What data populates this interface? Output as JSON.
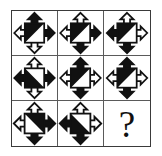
{
  "puzzle": {
    "type": "visual-analogy-matrix",
    "rows": 3,
    "columns": 3,
    "missing_cell_label": "?",
    "colors": {
      "fill_dark": "#111111",
      "fill_light": "#ffffff",
      "stroke": "#111111",
      "grid_line": "#5a5a5a",
      "outer_border": "#3a3a3a",
      "background": "#ffffff"
    },
    "cells": [
      {
        "id": "cell-1-1",
        "position": "row 1, column 1",
        "kind": "figure",
        "square_diagonal": "bottom-left-to-top-right",
        "square_dark_half": "upper-left",
        "arrows": {
          "up": "dark",
          "left": "light",
          "right": "dark",
          "down": "light"
        }
      },
      {
        "id": "cell-1-2",
        "position": "row 1, column 2",
        "kind": "figure",
        "square_diagonal": "bottom-left-to-top-right",
        "square_dark_half": "upper-left",
        "arrows": {
          "up": "light",
          "left": "light",
          "right": "dark",
          "down": "dark"
        }
      },
      {
        "id": "cell-1-3",
        "position": "row 1, column 3",
        "kind": "figure",
        "square_diagonal": "bottom-left-to-top-right",
        "square_dark_half": "upper-left",
        "arrows": {
          "up": "light",
          "left": "dark",
          "right": "light",
          "down": "dark"
        }
      },
      {
        "id": "cell-2-1",
        "position": "row 2, column 1",
        "kind": "figure",
        "square_diagonal": "top-left-to-bottom-right",
        "square_dark_half": "lower-left",
        "arrows": {
          "up": "light",
          "left": "dark",
          "right": "dark",
          "down": "light"
        }
      },
      {
        "id": "cell-2-2",
        "position": "row 2, column 2",
        "kind": "figure",
        "square_diagonal": "bottom-left-to-top-right",
        "square_dark_half": "upper-left",
        "arrows": {
          "up": "dark",
          "left": "light",
          "right": "light",
          "down": "dark"
        }
      },
      {
        "id": "cell-2-3",
        "position": "row 2, column 3",
        "kind": "figure",
        "square_diagonal": "bottom-left-to-top-right",
        "square_dark_half": "upper-left",
        "arrows": {
          "up": "dark",
          "left": "light",
          "right": "light",
          "down": "dark"
        }
      },
      {
        "id": "cell-3-1",
        "position": "row 3, column 1",
        "kind": "figure",
        "square_diagonal": "top-left-to-bottom-right",
        "square_dark_half": "lower-right",
        "arrows": {
          "up": "light",
          "left": "light",
          "right": "dark",
          "down": "dark"
        }
      },
      {
        "id": "cell-3-2",
        "position": "row 3, column 2",
        "kind": "figure",
        "square_diagonal": "top-left-to-bottom-right",
        "square_dark_half": "lower-left",
        "arrows": {
          "up": "light",
          "left": "dark",
          "right": "light",
          "down": "dark"
        }
      },
      {
        "id": "cell-3-3",
        "position": "row 3, column 3",
        "kind": "question",
        "label": "?"
      }
    ]
  }
}
